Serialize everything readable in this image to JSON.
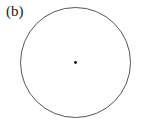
{
  "figure": {
    "label": "(b)",
    "circle": {
      "cx": 75.5,
      "cy": 62.5,
      "r": 55,
      "stroke": "#444444",
      "stroke_width": 0.9
    },
    "center_point": {
      "cx": 75.5,
      "cy": 62.5,
      "r": 1.4,
      "fill": "#111111"
    }
  }
}
